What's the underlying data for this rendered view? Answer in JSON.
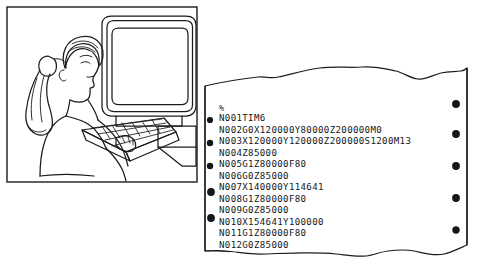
{
  "figure": {
    "kind": "line-art-illustration-with-cnc-tape-printout",
    "panels": [
      "operator-at-computer-illustration",
      "torn-nc-program-printout"
    ]
  },
  "illustration": {
    "name": "person-seated-at-computer-terminal",
    "elements": [
      "crt-monitor",
      "monitor-screen",
      "keyboard",
      "desk",
      "seated-person",
      "ponytail-hair",
      "hands-on-keyboard"
    ],
    "style": "black-outline-line-drawing-on-white"
  },
  "printout": {
    "name": "nc-program-torn-paper-tape",
    "left_holes": 5,
    "right_holes": 5,
    "edge_style": "torn-wavy-top-and-bottom",
    "ink": "#15171a",
    "paper": "#ffffff",
    "program_start_marker": "%",
    "lines": [
      "%",
      "N001TIM6",
      "N002G0X120000Y80000Z200000M0",
      "N003X120000Y120000Z200000S1200M13",
      "N004Z85000",
      "N005G1Z80000F80",
      "N006G0Z85000",
      "N007X140000Y114641",
      "N008G1Z80000F80",
      "N009G0Z85000",
      "N010X154641Y100000",
      "N011G1Z80000F80",
      "N012G0Z85000"
    ]
  },
  "colors": {
    "ink": "#15171a",
    "paper": "#ffffff",
    "outline": "#1a1c1f"
  }
}
